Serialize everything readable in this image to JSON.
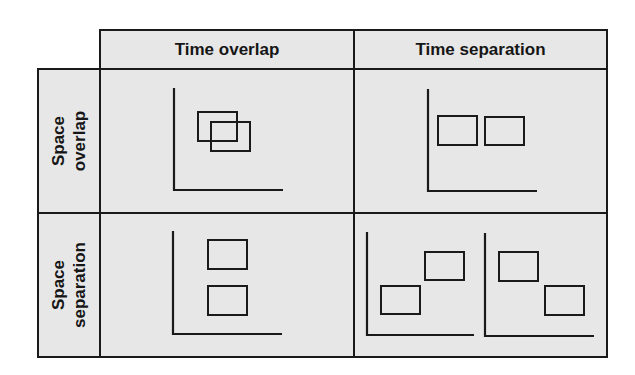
{
  "diagram": {
    "columns": [
      {
        "label": "Time overlap"
      },
      {
        "label": "Time separation"
      }
    ],
    "rows": [
      {
        "label_line1": "Space",
        "label_line2": "overlap"
      },
      {
        "label_line1": "Space",
        "label_line2": "separation"
      }
    ],
    "colors": {
      "cell_bg": "#e7e7e7",
      "line": "#1a1a1a",
      "page_bg": "#ffffff"
    },
    "panels": [
      {
        "name": "space-overlap-time-overlap",
        "axes": [
          {
            "x": 174,
            "y_top": 88,
            "y_bottom": 190,
            "x_end": 283
          }
        ],
        "rects": [
          {
            "x": 198,
            "y": 112,
            "w": 39,
            "h": 29
          },
          {
            "x": 211,
            "y": 122,
            "w": 39,
            "h": 29
          }
        ]
      },
      {
        "name": "space-overlap-time-separation",
        "axes": [
          {
            "x": 428,
            "y_top": 89,
            "y_bottom": 191,
            "x_end": 537
          }
        ],
        "rects": [
          {
            "x": 438,
            "y": 116,
            "w": 39,
            "h": 29
          },
          {
            "x": 485,
            "y": 117,
            "w": 39,
            "h": 28
          }
        ]
      },
      {
        "name": "space-separation-time-overlap",
        "axes": [
          {
            "x": 173,
            "y_top": 231,
            "y_bottom": 334,
            "x_end": 282
          }
        ],
        "rects": [
          {
            "x": 208,
            "y": 240,
            "w": 39,
            "h": 29
          },
          {
            "x": 208,
            "y": 286,
            "w": 39,
            "h": 29
          }
        ]
      },
      {
        "name": "space-separation-time-separation",
        "axes": [
          {
            "x": 367,
            "y_top": 232,
            "y_bottom": 335,
            "x_end": 474
          },
          {
            "x": 485,
            "y_top": 233,
            "y_bottom": 336,
            "x_end": 594
          }
        ],
        "rects": [
          {
            "x": 381,
            "y": 286,
            "w": 39,
            "h": 28
          },
          {
            "x": 425,
            "y": 252,
            "w": 39,
            "h": 28
          },
          {
            "x": 499,
            "y": 252,
            "w": 39,
            "h": 29
          },
          {
            "x": 545,
            "y": 286,
            "w": 39,
            "h": 29
          }
        ]
      }
    ]
  }
}
